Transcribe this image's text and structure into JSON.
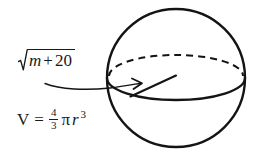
{
  "canvas": {
    "width": 256,
    "height": 154,
    "background": "#ffffff",
    "ink_color": "#1a1a1a"
  },
  "figure": {
    "kind": "sphere-volume-diagram"
  },
  "labels": {
    "radical": {
      "radical_symbol": "√",
      "radicand_variable": "m",
      "radicand_operator": "+",
      "radicand_constant": "20",
      "plain_text": "√(m + 20)"
    },
    "volume": {
      "lhs": "V",
      "equals": "=",
      "fraction_numerator": "4",
      "fraction_denominator": "3",
      "pi": "π",
      "variable": "r",
      "exponent": "3",
      "plain_text": "V = 4/3 π r³"
    }
  },
  "geometry": {
    "sphere": {
      "cx": 176,
      "cy": 78,
      "r": 69
    },
    "equator": {
      "cx": 176,
      "cy": 78,
      "rx": 69,
      "ry": 22
    },
    "radius_line": {
      "x1": 131,
      "y1": 96,
      "x2": 176,
      "y2": 76
    },
    "leader": {
      "start_x": 45,
      "start_y": 84,
      "arrow_x": 141,
      "arrow_y": 83
    }
  },
  "strokes": {
    "sphere_outline_width": 2.4,
    "equator_solid_width": 2.2,
    "equator_dashed_width": 2.0,
    "equator_dash_pattern": "7 5",
    "radius_width": 2.0,
    "leader_width": 1.3
  }
}
